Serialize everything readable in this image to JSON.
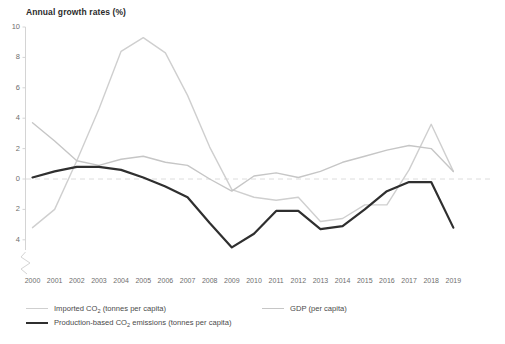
{
  "chart_data": {
    "type": "line",
    "title": "Annual growth rates (%)",
    "xlabel": "",
    "ylabel": "Annual growth rates (%)",
    "x": [
      2000,
      2001,
      2002,
      2003,
      2004,
      2005,
      2006,
      2007,
      2008,
      2009,
      2010,
      2011,
      2012,
      2013,
      2014,
      2015,
      2016,
      2017,
      2018,
      2019
    ],
    "categories": [
      "2000",
      "2001",
      "2002",
      "2003",
      "2004",
      "2005",
      "2006",
      "2007",
      "2008",
      "2009",
      "2010",
      "2011",
      "2012",
      "2013",
      "2014",
      "2015",
      "2016",
      "2017",
      "2018",
      "2019"
    ],
    "ylim": [
      -5,
      10
    ],
    "yticks": [
      10,
      8,
      6,
      4,
      2,
      0,
      -2,
      -4
    ],
    "ytick_labels": [
      "10",
      "8",
      "6",
      "4",
      "2",
      "0",
      "2",
      "4"
    ],
    "grid": false,
    "zero_line": true,
    "axis_break": true,
    "legend_position": "bottom",
    "series": [
      {
        "name": "Imported CO2 (tonnes per capita)",
        "color": "#cfcfcf",
        "width": 1.4,
        "values": [
          -3.2,
          -2.0,
          1.2,
          4.6,
          8.4,
          9.3,
          8.3,
          5.5,
          2.1,
          -0.7,
          -1.2,
          -1.4,
          -1.2,
          -2.8,
          -2.6,
          -1.7,
          -1.7,
          0.6,
          3.6,
          0.5
        ]
      },
      {
        "name": "GDP (per capita)",
        "color": "#c6c6c6",
        "width": 1.4,
        "values": [
          3.7,
          2.5,
          1.2,
          0.9,
          1.3,
          1.5,
          1.1,
          0.9,
          0.0,
          -0.8,
          0.2,
          0.4,
          0.1,
          0.5,
          1.1,
          1.5,
          1.9,
          2.2,
          2.0,
          0.5
        ]
      },
      {
        "name": "Production-based CO2 emissions (tonnes per capita)",
        "color": "#2f2f2f",
        "width": 2.2,
        "values": [
          0.1,
          0.5,
          0.8,
          0.8,
          0.6,
          0.1,
          -0.5,
          -1.2,
          -2.9,
          -4.5,
          -3.6,
          -2.1,
          -2.1,
          -3.3,
          -3.1,
          -2.0,
          -0.8,
          -0.2,
          -0.2,
          -3.2
        ]
      }
    ]
  },
  "legend": {
    "items": [
      {
        "label_prefix": "Imported CO",
        "label_sub": "2",
        "label_suffix": " (tonnes per capita)",
        "swatch": "line-light"
      },
      {
        "label_prefix": "Production-based CO",
        "label_sub": "2",
        "label_suffix": " emissions (tonnes per capita)",
        "swatch": "line-dark"
      },
      {
        "label_prefix": "GDP (per capita)",
        "label_sub": "",
        "label_suffix": "",
        "swatch": "line-light"
      }
    ]
  },
  "colors": {
    "imported": "#cfcfcf",
    "gdp": "#c6c6c6",
    "production": "#2f2f2f",
    "axis": "#d4d4d4",
    "zero_line": "#dcdcdc",
    "text": "#6e6e6e"
  }
}
